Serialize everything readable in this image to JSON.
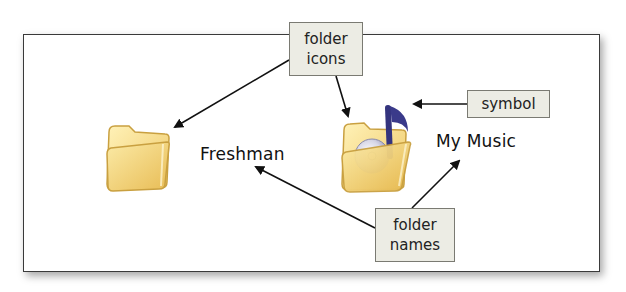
{
  "diagram": {
    "folders": [
      {
        "name": "Freshman",
        "icon": "folder-icon"
      },
      {
        "name": "My Music",
        "icon": "music-folder-icon",
        "symbol": "music-note"
      }
    ],
    "callouts": {
      "folder_icons": {
        "line1": "folder",
        "line2": "icons"
      },
      "symbol": {
        "line1": "symbol"
      },
      "folder_names": {
        "line1": "folder",
        "line2": "names"
      }
    },
    "colors": {
      "folder_fill": "#f4dc84",
      "folder_edge": "#c9a040",
      "note": "#3a3a8a",
      "callout_bg": "#ecece4",
      "frame_border": "#3a3a3a"
    }
  }
}
